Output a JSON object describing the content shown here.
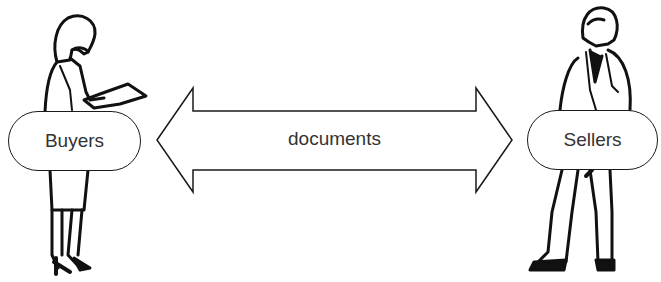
{
  "diagram": {
    "left_party": {
      "label": "Buyers"
    },
    "right_party": {
      "label": "Sellers"
    },
    "arrow": {
      "label": "documents",
      "direction": "bidirectional"
    }
  },
  "colors": {
    "stroke": "#1a1a1a",
    "text": "#333333",
    "background": "#ffffff"
  }
}
